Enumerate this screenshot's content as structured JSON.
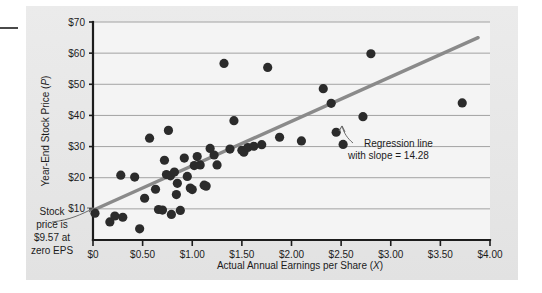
{
  "chart_data": {
    "type": "scatter",
    "title": "",
    "xlabel": "Actual Annual Earnings per Share (X)",
    "ylabel": "Year-End Stock Price (P)",
    "xlim": [
      0,
      4.0
    ],
    "ylim": [
      0,
      70
    ],
    "grid": true,
    "legend_position": "none",
    "x_tick_labels": [
      "$0",
      "$0.50",
      "$1.00",
      "$1.50",
      "$2.00",
      "$2.50",
      "$3.00",
      "$3.50",
      "$4.00"
    ],
    "x_tick_values": [
      0,
      0.5,
      1.0,
      1.5,
      2.0,
      2.5,
      3.0,
      3.5,
      4.0
    ],
    "y_tick_labels": [
      "$10",
      "$20",
      "$30",
      "$40",
      "$50",
      "$60",
      "$70"
    ],
    "y_tick_values": [
      10,
      20,
      30,
      40,
      50,
      60,
      70
    ],
    "series": [
      {
        "name": "Companies",
        "marker": "circle",
        "color": "#2b2b2b",
        "points": [
          [
            0.02,
            8.6
          ],
          [
            0.17,
            5.8
          ],
          [
            0.22,
            7.7
          ],
          [
            0.28,
            20.8
          ],
          [
            0.3,
            7.3
          ],
          [
            0.42,
            20.2
          ],
          [
            0.47,
            3.6
          ],
          [
            0.52,
            13.4
          ],
          [
            0.57,
            32.7
          ],
          [
            0.63,
            16.3
          ],
          [
            0.66,
            9.8
          ],
          [
            0.7,
            9.6
          ],
          [
            0.72,
            25.6
          ],
          [
            0.74,
            21.0
          ],
          [
            0.76,
            35.2
          ],
          [
            0.78,
            20.6
          ],
          [
            0.79,
            8.2
          ],
          [
            0.82,
            21.8
          ],
          [
            0.84,
            14.6
          ],
          [
            0.85,
            18.2
          ],
          [
            0.88,
            9.5
          ],
          [
            0.92,
            26.3
          ],
          [
            0.95,
            20.4
          ],
          [
            0.98,
            16.7
          ],
          [
            1.0,
            16.2
          ],
          [
            1.02,
            23.9
          ],
          [
            1.05,
            26.8
          ],
          [
            1.08,
            24.1
          ],
          [
            1.12,
            17.6
          ],
          [
            1.14,
            17.3
          ],
          [
            1.18,
            29.4
          ],
          [
            1.22,
            27.3
          ],
          [
            1.25,
            24.1
          ],
          [
            1.32,
            56.7
          ],
          [
            1.38,
            29.2
          ],
          [
            1.42,
            38.3
          ],
          [
            1.5,
            28.8
          ],
          [
            1.52,
            28.2
          ],
          [
            1.56,
            29.7
          ],
          [
            1.62,
            30.1
          ],
          [
            1.7,
            30.6
          ],
          [
            1.76,
            55.4
          ],
          [
            1.88,
            33.0
          ],
          [
            2.1,
            31.8
          ],
          [
            2.32,
            48.6
          ],
          [
            2.4,
            43.9
          ],
          [
            2.45,
            34.6
          ],
          [
            2.52,
            30.7
          ],
          [
            2.72,
            39.6
          ],
          [
            2.8,
            59.8
          ],
          [
            3.72,
            44.0
          ]
        ]
      }
    ],
    "regression": {
      "label_line_1": "Regression line",
      "label_line_2": "with slope = 14.28",
      "slope": 14.28,
      "intercept": 9.57,
      "color": "#8a8a8a",
      "x_start": 0,
      "x_end": 3.88
    },
    "annotations": [
      {
        "name": "intercept-annotation",
        "lines": [
          "Stock",
          "price is",
          "$9.57 at",
          "zero EPS"
        ],
        "target_x": 0,
        "target_y": 9.57
      }
    ]
  },
  "axes": {
    "y_title_prefix": "Year-End Stock Price (",
    "y_title_var": "P",
    "y_title_suffix": ")",
    "x_title_prefix": "Actual Annual Earnings per Share (",
    "x_title_var": "X",
    "x_title_suffix": ")"
  },
  "colors": {
    "panel": "#e9e9e9",
    "plot_background": "#f4f4f4",
    "axis": "#1c1c1c",
    "gridline": "#9a9a9a",
    "marker": "#2b2b2b",
    "regression": "#8a8a8a",
    "leader": "#6b6b6b"
  }
}
